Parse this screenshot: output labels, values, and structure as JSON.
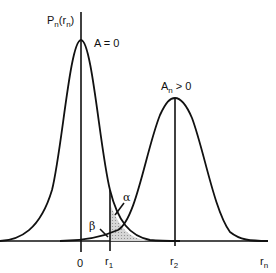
{
  "figure": {
    "y_axis_label": {
      "main": "P",
      "sub": "n",
      "arg_main": "r",
      "arg_sub": "n"
    },
    "curve_left_label": "A = 0",
    "curve_right_label": {
      "main": "A",
      "sub": "n",
      "rest": " > 0"
    },
    "alpha_label": "α",
    "beta_label": "β",
    "x_ticks": [
      {
        "main": "0",
        "sub": ""
      },
      {
        "main": "r",
        "sub": "1"
      },
      {
        "main": "r",
        "sub": "2"
      },
      {
        "main": "r",
        "sub": "n"
      }
    ],
    "colors": {
      "line": "#111111",
      "shade": "#bdbdbd"
    }
  }
}
